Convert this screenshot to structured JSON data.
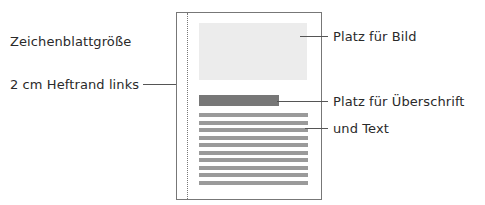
{
  "labels": {
    "sheet_size": "Zeichenblattgröße",
    "margin": "2 cm Heftrand links",
    "image_area": "Platz für Bild",
    "heading_area": "Platz für Überschrift",
    "text_area": "und Text"
  },
  "text_line_count": 10,
  "colors": {
    "border": "#777777",
    "image_fill": "#ececec",
    "heading_fill": "#777777",
    "text_fill": "#9a9a9a"
  }
}
